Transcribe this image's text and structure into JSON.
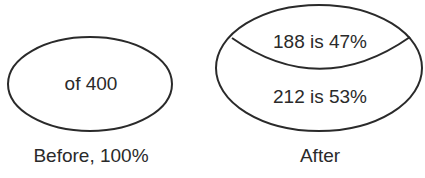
{
  "diagram": {
    "before": {
      "inner_text": "of 400",
      "caption": "Before, 100%"
    },
    "after": {
      "top_segment_text": "188 is 47%",
      "bottom_segment_text": "212 is 53%",
      "caption": "After"
    },
    "stroke_color": "#2a2a2a",
    "background_color": "#ffffff"
  }
}
